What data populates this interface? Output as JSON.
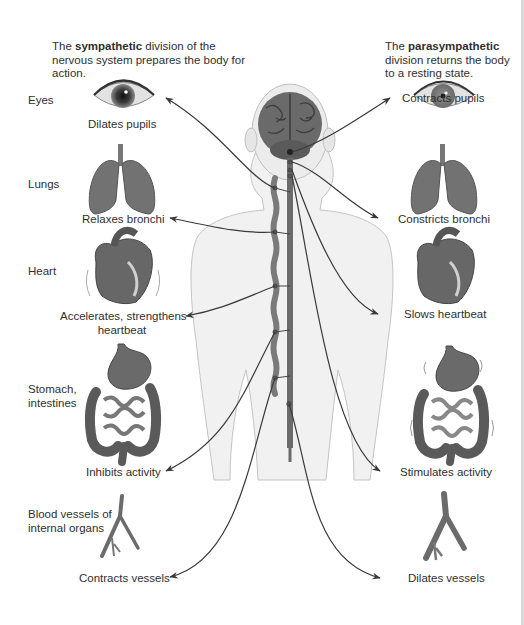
{
  "intro": {
    "sympathetic": {
      "prefix": "The ",
      "bold": "sympathetic",
      "rest": " division of the nervous system prepares the body for action."
    },
    "parasympathetic": {
      "prefix": "The ",
      "bold": "parasympathetic",
      "rest": " division returns the body to a resting state."
    }
  },
  "organs": [
    {
      "id": "eyes",
      "label": "Eyes",
      "sympathetic_effect": "Dilates pupils",
      "parasympathetic_effect": "Contracts pupils"
    },
    {
      "id": "lungs",
      "label": "Lungs",
      "sympathetic_effect": "Relaxes bronchi",
      "parasympathetic_effect": "Constricts bronchi"
    },
    {
      "id": "heart",
      "label": "Heart",
      "sympathetic_effect": "Accelerates, strengthens heartbeat",
      "parasympathetic_effect": "Slows heartbeat"
    },
    {
      "id": "stomach",
      "label": "Stomach, intestines",
      "sympathetic_effect": "Inhibits activity",
      "parasympathetic_effect": "Stimulates activity"
    },
    {
      "id": "vessels",
      "label": "Blood vessels of internal organs",
      "sympathetic_effect": "Contracts vessels",
      "parasympathetic_effect": "Dilates vessels"
    }
  ],
  "labels": {
    "heart_sym_line1": "Accelerates, strengthens",
    "heart_sym_line2": "heartbeat",
    "stomach_line1": "Stomach,",
    "stomach_line2": "intestines",
    "vessels_line1": "Blood vessels of",
    "vessels_line2": "internal organs"
  },
  "colors": {
    "organ_fill": "#6e6e6e",
    "organ_dark": "#4a4a4a",
    "nerve_line": "#3a3a3a",
    "body_fill": "#f1f1f1",
    "body_stroke": "#bdbdbd",
    "text": "#2f2f2f"
  }
}
